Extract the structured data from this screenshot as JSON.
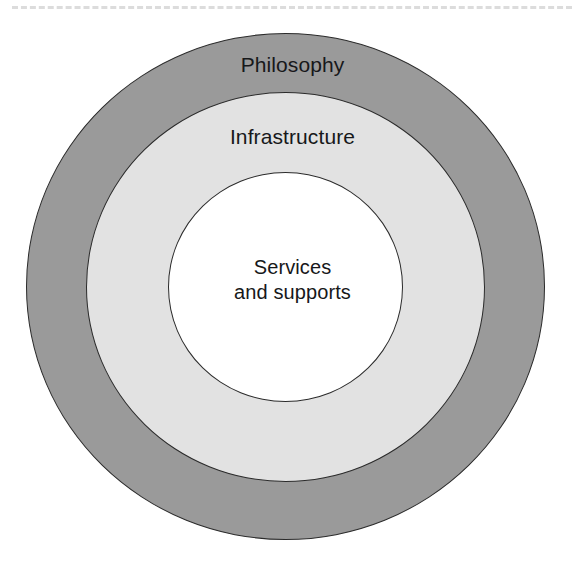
{
  "page": {
    "background_color": "#ffffff",
    "width": 585,
    "height": 567
  },
  "top_rule": {
    "style": "dashed",
    "color": "#dcdcdc"
  },
  "diagram": {
    "type": "concentric-circles",
    "title": "",
    "rings": [
      {
        "id": "philosophy",
        "label": "Philosophy",
        "level": "outer",
        "fill_color": "#9a9a9a",
        "stroke_color": "#2b2b2b"
      },
      {
        "id": "infrastructure",
        "label": "Infrastructure",
        "level": "middle",
        "fill_color": "#e2e2e2",
        "stroke_color": "#2b2b2b"
      },
      {
        "id": "services",
        "label": "Services\nand supports",
        "level": "inner",
        "fill_color": "#ffffff",
        "stroke_color": "#2b2b2b"
      }
    ]
  }
}
